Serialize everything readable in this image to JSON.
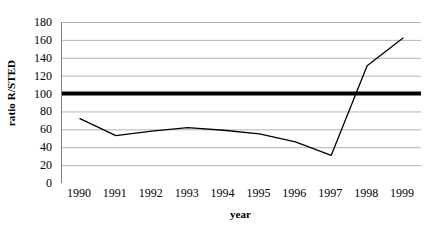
{
  "chart_data": {
    "type": "line",
    "title": "",
    "xlabel": "year",
    "ylabel": "ratio R/STED",
    "categories": [
      "1990",
      "1991",
      "1992",
      "1993",
      "1994",
      "1995",
      "1996",
      "1997",
      "1998",
      "1999"
    ],
    "series": [
      {
        "name": "ratio R/STED",
        "values": [
          72,
          53,
          58,
          62,
          59,
          55,
          46,
          31,
          131,
          162
        ],
        "color": "#000000",
        "line_width": 1.3
      }
    ],
    "reference_lines": [
      {
        "name": "parity-line",
        "value": 100,
        "orientation": "horizontal",
        "color": "#000000",
        "line_width": 4
      }
    ],
    "ylim": [
      0,
      180
    ],
    "yticks": [
      180,
      160,
      140,
      120,
      100,
      80,
      60,
      40,
      20,
      0
    ],
    "xtick_labels": [
      "1990",
      "1991",
      "1992",
      "1993",
      "1994",
      "1995",
      "1996",
      "1997",
      "1998",
      "1999"
    ],
    "grid": {
      "horizontal": true,
      "vertical": false,
      "color": "#b3b3b3"
    },
    "legend": {
      "visible": false,
      "position": "none"
    },
    "axis_color": "#808080",
    "background": "#ffffff"
  }
}
